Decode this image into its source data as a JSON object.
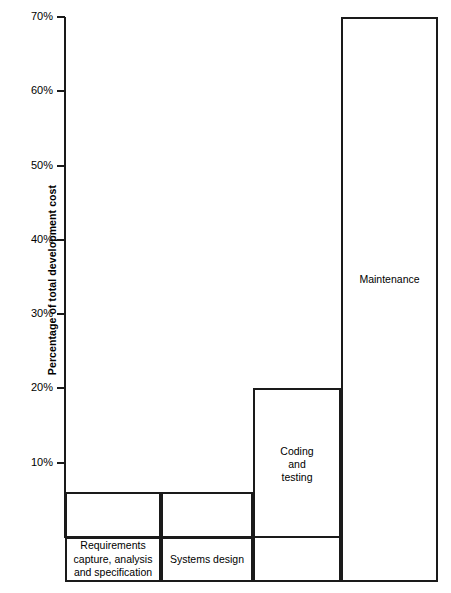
{
  "chart_data": {
    "type": "bar",
    "title": "",
    "subtitle": "",
    "xlabel": "",
    "ylabel": "Percentage of total development cost",
    "ylim": [
      0,
      70
    ],
    "grid": false,
    "legend": null,
    "categories": [
      "Requirements\ncapture, analysis\nand specification",
      "Systems design",
      "Coding\nand\ntesting",
      "Maintenance"
    ],
    "values": [
      6,
      6,
      20,
      70
    ],
    "tick_labels": [
      "70%",
      "60%",
      "50%",
      "40%",
      "30%",
      "20%",
      "10%"
    ],
    "tick_values": [
      70,
      60,
      50,
      40,
      30,
      20,
      10
    ],
    "bar_inner_labels": [
      "",
      "",
      "Coding\nand\ntesting",
      "Maintenance"
    ],
    "axis_color": "#1a1a1a",
    "bar_fill": "#ffffff",
    "bar_border": "#1a1a1a"
  },
  "axis": {
    "y_label": "Percentage of total development cost"
  },
  "ticks": [
    {
      "label": "70%",
      "value": 70
    },
    {
      "label": "60%",
      "value": 60
    },
    {
      "label": "50%",
      "value": 50
    },
    {
      "label": "40%",
      "value": 40
    },
    {
      "label": "30%",
      "value": 30
    },
    {
      "label": "20%",
      "value": 20
    },
    {
      "label": "10%",
      "value": 10
    }
  ],
  "bars": [
    {
      "name": "requirements",
      "value": 6,
      "inner_label": "",
      "category_label": "Requirements\ncapture, analysis\nand specification"
    },
    {
      "name": "systems-design",
      "value": 6,
      "inner_label": "",
      "category_label": "Systems design"
    },
    {
      "name": "coding-and-testing",
      "value": 20,
      "inner_label": "Coding\nand\ntesting",
      "category_label": ""
    },
    {
      "name": "maintenance",
      "value": 70,
      "inner_label": "Maintenance",
      "category_label": ""
    }
  ]
}
